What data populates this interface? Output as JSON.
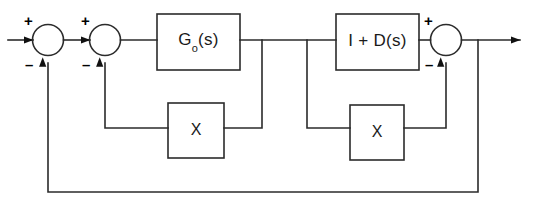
{
  "diagram": {
    "type": "control-system-block-diagram",
    "line_color": "#2b2b2b",
    "text_color": "#1a1a1a",
    "background": "#ffffff",
    "blocks": [
      {
        "id": "forward-plant",
        "label_main": "G",
        "label_sub": "o",
        "label_tail": "(s)",
        "label_full": "Go(s)"
      },
      {
        "id": "compensator",
        "label_full": "I + D(s)"
      },
      {
        "id": "inner-feedback-gain-left",
        "label_full": "X"
      },
      {
        "id": "inner-feedback-gain-right",
        "label_full": "X"
      }
    ],
    "summing_junctions": [
      {
        "id": "sum-1",
        "plus": "+",
        "minus": "–"
      },
      {
        "id": "sum-2",
        "plus": "+",
        "minus": "–"
      },
      {
        "id": "sum-3",
        "plus": "+",
        "minus": "–"
      }
    ]
  }
}
